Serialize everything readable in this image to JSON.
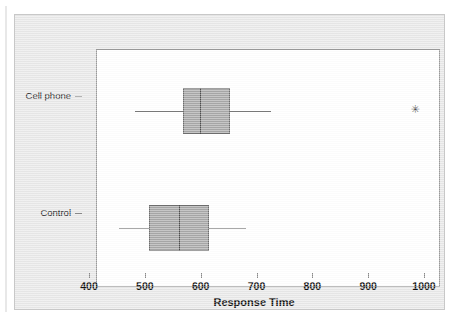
{
  "chart_data": {
    "type": "box",
    "title": "",
    "xlabel": "Response Time",
    "ylabel": "",
    "xlim": [
      400,
      1000
    ],
    "xticks": [
      400,
      500,
      600,
      700,
      800,
      900,
      1000
    ],
    "xticklabels": [
      "400",
      "500",
      "600",
      "700",
      "800",
      "900",
      "1000"
    ],
    "categories": [
      "Cell phone",
      "Control"
    ],
    "orientation": "horizontal",
    "grid": false,
    "legend": false,
    "boxes": [
      {
        "category": "Cell phone",
        "whisker_low": 455,
        "q1": 542,
        "median": 572,
        "q3": 625,
        "whisker_high": 700,
        "outliers": [
          956
        ]
      },
      {
        "category": "Control",
        "whisker_low": 427,
        "q1": 480,
        "median": 534,
        "q3": 588,
        "whisker_high": 654,
        "outliers": []
      }
    ],
    "colors": {
      "box_fill": "#a8a8a8",
      "box_edge": "#6e6e6e",
      "median": "#4d4d4d",
      "whisker": "#7a7a7a",
      "outlier": "#4a4a4a",
      "plot_background": "#ffffff",
      "panel_background": "#e9e9e9",
      "frame": "#9a9a9a"
    },
    "outlier_marker": "✳"
  }
}
